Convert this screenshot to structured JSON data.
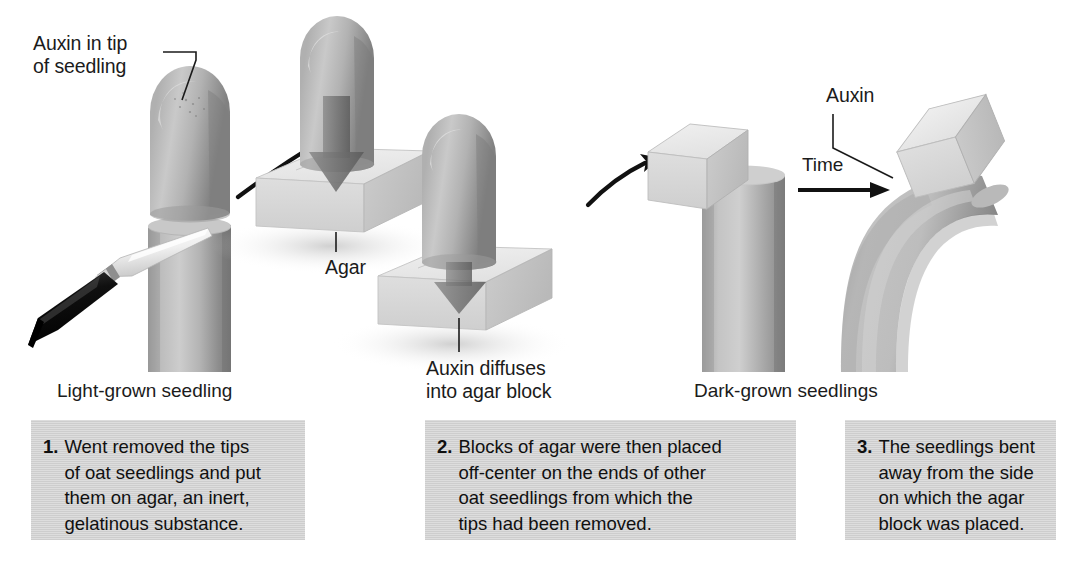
{
  "figure": {
    "domain": "biology-diagram"
  },
  "callouts": {
    "auxin_in_tip": "Auxin in tip\nof seedling",
    "agar": "Agar",
    "auxin_diffuses": "Auxin diffuses\ninto agar block",
    "auxin_block": "Auxin",
    "time": "Time"
  },
  "stage_labels": {
    "light_grown": "Light-grown seedling",
    "dark_grown": "Dark-grown seedlings"
  },
  "captions": [
    {
      "number": "1.",
      "text": "Went removed the tips\nof oat seedlings and put\nthem on agar, an inert,\ngelatinous substance."
    },
    {
      "number": "2.",
      "text": "Blocks of agar were then placed\noff-center on the ends of other\noat seedlings from which the\ntips had been removed."
    },
    {
      "number": "3.",
      "text": "The seedlings bent\naway from the side\non which the agar\nblock was placed."
    }
  ],
  "colors": {
    "background": "#ffffff",
    "caption_box": "#cfcfcf",
    "text": "#1b1b1b",
    "seedling_light": "#c6c6c6",
    "seedling_mid": "#a8a8a8",
    "seedling_dark": "#7e7e7e",
    "agar_top": "#eaeaea",
    "agar_front": "#d8d8d8",
    "agar_side": "#c4c4c4",
    "arrow": "#111111",
    "scalpel_handle": "#141414",
    "scalpel_blade": "#f2f2f2"
  },
  "graphics": {
    "seedling_tip_icon": "oat-coleoptile-tip",
    "scalpel_icon": "scalpel",
    "agar_block_icon": "agar-cube",
    "diffusion_arrow_icon": "downward-arrow",
    "transfer_arrow_icon": "curved-arrow",
    "time_arrow_icon": "straight-arrow",
    "bent_seedling_icon": "curved-coleoptile"
  }
}
